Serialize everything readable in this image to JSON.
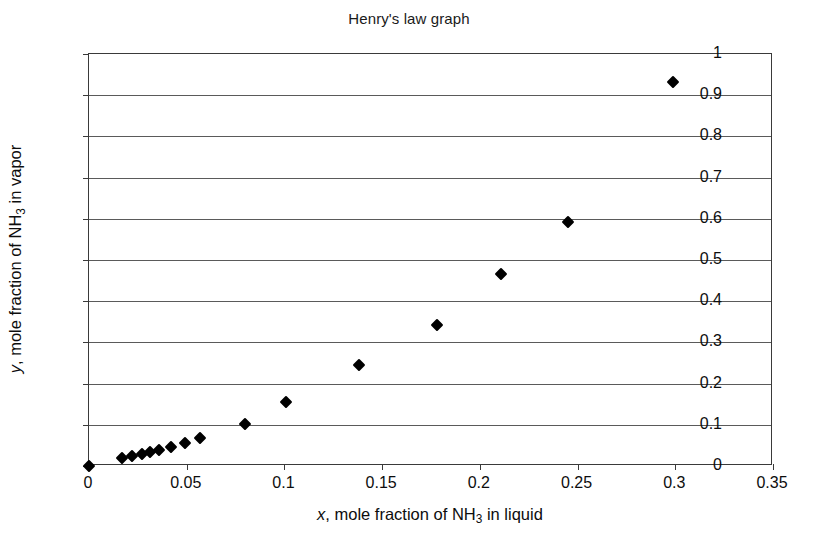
{
  "chart_data": {
    "type": "scatter",
    "title": "Henry's law graph",
    "xlabel_parts": {
      "symbol": "x",
      "text_before": ", mole fraction of NH",
      "subscript": "3",
      "text_after": " in liquid"
    },
    "ylabel_parts": {
      "symbol": "y",
      "text_before": ", mole fraction of NH",
      "subscript": "3",
      "text_after": " in vapor"
    },
    "xlabel": "x, mole fraction of NH3 in liquid",
    "ylabel": "y, mole fraction of NH3 in vapor",
    "xlim": [
      0,
      0.35
    ],
    "ylim": [
      0,
      1
    ],
    "xticks": [
      0,
      0.05,
      0.1,
      0.15,
      0.2,
      0.25,
      0.3,
      0.35
    ],
    "xtick_labels": [
      "0",
      "0.05",
      "0.1",
      "0.15",
      "0.2",
      "0.25",
      "0.3",
      "0.35"
    ],
    "yticks": [
      0,
      0.1,
      0.2,
      0.3,
      0.4,
      0.5,
      0.6,
      0.7,
      0.8,
      0.9,
      1
    ],
    "ytick_labels": [
      "0",
      "0.1",
      "0.2",
      "0.3",
      "0.4",
      "0.5",
      "0.6",
      "0.7",
      "0.8",
      "0.9",
      "1"
    ],
    "grid": "horizontal",
    "legend": "none",
    "marker": "diamond",
    "marker_color": "#000000",
    "x": [
      0.0,
      0.017,
      0.022,
      0.027,
      0.031,
      0.036,
      0.042,
      0.049,
      0.057,
      0.08,
      0.101,
      0.138,
      0.178,
      0.211,
      0.245,
      0.299
    ],
    "y": [
      0.0,
      0.019,
      0.025,
      0.03,
      0.034,
      0.04,
      0.046,
      0.055,
      0.067,
      0.103,
      0.155,
      0.245,
      0.342,
      0.466,
      0.592,
      0.932
    ],
    "points": [
      {
        "x": 0.0,
        "y": 0.0
      },
      {
        "x": 0.017,
        "y": 0.019
      },
      {
        "x": 0.022,
        "y": 0.025
      },
      {
        "x": 0.027,
        "y": 0.03
      },
      {
        "x": 0.031,
        "y": 0.034
      },
      {
        "x": 0.036,
        "y": 0.04
      },
      {
        "x": 0.042,
        "y": 0.046
      },
      {
        "x": 0.049,
        "y": 0.055
      },
      {
        "x": 0.057,
        "y": 0.067
      },
      {
        "x": 0.08,
        "y": 0.103
      },
      {
        "x": 0.101,
        "y": 0.155
      },
      {
        "x": 0.138,
        "y": 0.245
      },
      {
        "x": 0.178,
        "y": 0.342
      },
      {
        "x": 0.211,
        "y": 0.466
      },
      {
        "x": 0.245,
        "y": 0.592
      },
      {
        "x": 0.299,
        "y": 0.932
      }
    ]
  }
}
